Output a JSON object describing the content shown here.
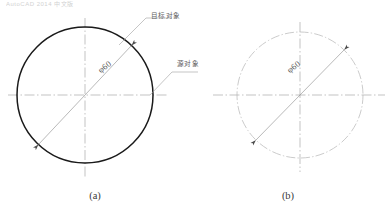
{
  "figure": {
    "background_color": "#ffffff",
    "top_cropped_text": "AutoCAD 2014 中文版",
    "captions": {
      "left": "(a)",
      "right": "(b)"
    },
    "annotations": {
      "target_object_label": "目标对象",
      "source_object_label": "源对象"
    },
    "dimensions": {
      "left_circle_diameter": "φ60",
      "right_circle_diameter": "φ60"
    },
    "colors": {
      "target_circle_stroke": "#1a1a1a",
      "result_circle_stroke": "#b9b9b9",
      "centerline_stroke": "#9a9a9a",
      "dimension_stroke": "#8a8a8a",
      "leader_stroke": "#9e9e9e",
      "caption_text": "#3a3a3a",
      "label_text": "#5d5d5d"
    },
    "shapes": {
      "left_circle": {
        "name": "target-object-circle",
        "center_x": 85,
        "center_y": 95,
        "radius": 68,
        "linetype": "continuous",
        "stroke_width": 1.5
      },
      "right_circle": {
        "name": "result-object-circle",
        "center_x": 300,
        "center_y": 95,
        "radius": 63,
        "linetype": "center-dash-dot",
        "stroke_width": 0.7
      }
    }
  }
}
